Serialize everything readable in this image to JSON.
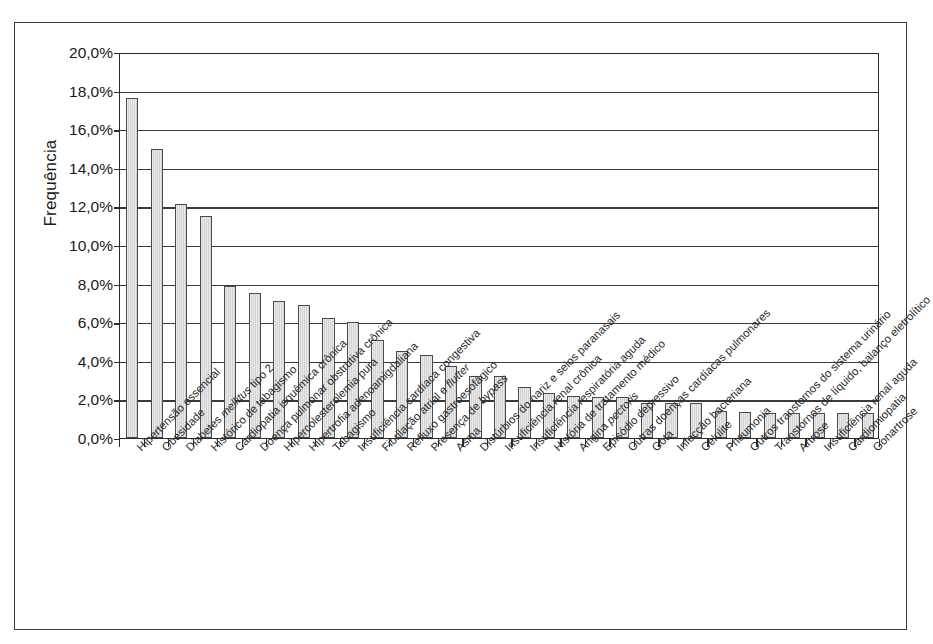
{
  "figure": {
    "y_axis_title": "Frequência",
    "y_tick_labels": [
      "0,0%",
      "2,0%",
      "4,0%",
      "6,0%",
      "8,0%",
      "10,0%",
      "12,0%",
      "14,0%",
      "16,0%",
      "18,0%",
      "20,0%"
    ],
    "frame_color": "#3a3a3a",
    "bar_fill_color": "#d2d2d2",
    "bar_border_color": "#4a4a4a"
  },
  "chart_data": {
    "type": "bar",
    "title": "",
    "xlabel": "",
    "ylabel": "Frequência",
    "ylim": [
      0,
      20
    ],
    "ytick_values": [
      0,
      2,
      4,
      6,
      8,
      10,
      12,
      14,
      16,
      18,
      20
    ],
    "ytick_labels": [
      "0,0%",
      "2,0%",
      "4,0%",
      "6,0%",
      "8,0%",
      "10,0%",
      "12,0%",
      "14,0%",
      "16,0%",
      "18,0%",
      "20,0%"
    ],
    "unit": "%",
    "grid": true,
    "grid_axis": "y",
    "legend": false,
    "orientation": "vertical",
    "categories": [
      "Hipertensão essencial",
      "Obesidade",
      "Diabetes mellitus tipo 2",
      "Histórico de tabagismo",
      "Cardiopatia isquêmica crônica",
      "Doença pulmonar obstrutiva crônica",
      "Hipercolesterolemia pura",
      "Hipertrofia adenoamigdaliana",
      "Tabagismo",
      "Insuficiência cardíaca congestiva",
      "Fibrilação atrial e flutter",
      "Refluxo gastroesofágico",
      "Presença de bypass",
      "Asma",
      "Distúrbios do nariz e seios paranasais",
      "Insuficiência renal crônica",
      "Insuficiência respiratória aguda",
      "História de tratamento médico",
      "Angina pectoris",
      "Episódio depressivo",
      "Outras doenças cardíacas pulmonares",
      "Gota",
      "Infecção bacteriana",
      "Celulite",
      "Pneumonia",
      "Outros transtornos do sistema urinário",
      "Transtornos de líquido, balanço eletrolítico",
      "Artrose",
      "Insuficiência renal aguda",
      "Cardiomiopatia",
      "Gonartrose"
    ],
    "values": [
      17.6,
      15.0,
      12.1,
      11.5,
      7.9,
      7.5,
      7.1,
      6.9,
      6.2,
      6.0,
      5.1,
      4.5,
      4.3,
      3.75,
      3.2,
      3.2,
      2.65,
      2.35,
      2.2,
      2.1,
      2.1,
      1.8,
      1.8,
      1.8,
      1.4,
      1.35,
      1.3,
      1.3,
      1.3,
      1.3,
      1.3
    ],
    "italic_segments": {
      "Diabetes mellitus tipo 2": "mellitus",
      "Fibrilação atrial e flutter": "flutter",
      "Presença de bypass": "bypass",
      "Angina pectoris": "pectoris"
    }
  }
}
